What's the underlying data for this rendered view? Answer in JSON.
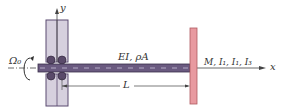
{
  "diagram": {
    "type": "rotating beam with tip mass",
    "labels": {
      "y_axis": "y",
      "x_axis": "x",
      "rotation": "Ω₀",
      "beam_props": "EI, ρA",
      "tip_props": "M, I₁, I₁, I₃",
      "length": "L"
    },
    "colors": {
      "beam": "#6a5a80",
      "housing": "#d6d0de",
      "housing_stroke": "#5a4a70",
      "tip_mass": "#e89aa0",
      "tip_mass_stroke": "#b05a60",
      "line": "#444444"
    }
  }
}
